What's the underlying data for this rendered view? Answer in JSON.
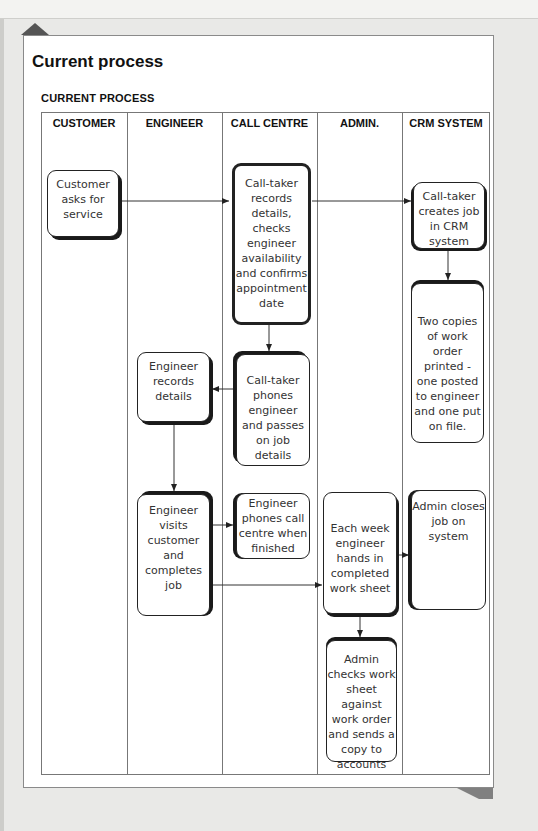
{
  "title": "Current process",
  "subtitle": "CURRENT PROCESS",
  "columns": [
    {
      "label": "CUSTOMER"
    },
    {
      "label": "ENGINEER"
    },
    {
      "label": "CALL CENTRE"
    },
    {
      "label": "ADMIN."
    },
    {
      "label": "CRM SYSTEM"
    }
  ],
  "steps": {
    "customer_asks": "Customer asks for service",
    "calltaker_records": "Call-taker records details, checks engineer availability and confirms appointment date",
    "calltaker_creates_job": "Call-taker creates job in CRM system",
    "two_copies_printed": "Two copies of work order printed - one posted to engineer and one put on file.",
    "calltaker_phones": "Call-taker phones engineer and passes on job details",
    "engineer_records": "Engineer records details",
    "engineer_visits": "Engineer visits customer and completes job",
    "engineer_phones": "Engineer phones call centre when finished",
    "weekly_worksheet": "Each week engineer hands in completed work sheet",
    "admin_closes": "Admin closes job on system",
    "admin_checks": "Admin checks work sheet against work order and sends a copy to accounts"
  },
  "flows": [
    {
      "from": "customer_asks",
      "to": "calltaker_records"
    },
    {
      "from": "calltaker_records",
      "to": "calltaker_creates_job"
    },
    {
      "from": "calltaker_creates_job",
      "to": "two_copies_printed"
    },
    {
      "from": "calltaker_records",
      "to": "calltaker_phones"
    },
    {
      "from": "calltaker_phones",
      "to": "engineer_records"
    },
    {
      "from": "engineer_records",
      "to": "engineer_visits"
    },
    {
      "from": "engineer_visits",
      "to": "engineer_phones"
    },
    {
      "from": "engineer_visits",
      "to": "weekly_worksheet"
    },
    {
      "from": "weekly_worksheet",
      "to": "admin_closes"
    },
    {
      "from": "weekly_worksheet",
      "to": "admin_checks"
    }
  ]
}
